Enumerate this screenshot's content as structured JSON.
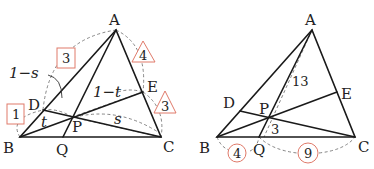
{
  "accent_color": "#e07a6a",
  "left_diagram": {
    "points": {
      "A": "A",
      "B": "B",
      "C": "C",
      "D": "D",
      "E": "E",
      "P": "P",
      "Q": "Q"
    },
    "segment_labels": {
      "one_minus_s": "1−s",
      "one_minus_t": "1−t",
      "t": "t",
      "s": "s"
    },
    "ratio_boxes": {
      "square_3": "3",
      "square_1": "1",
      "triangle_4": "4",
      "triangle_3": "3"
    }
  },
  "right_diagram": {
    "points": {
      "A": "A",
      "B": "B",
      "C": "C",
      "D": "D",
      "E": "E",
      "P": "P",
      "Q": "Q"
    },
    "segment_labels": {
      "AP": "13",
      "PQ": "3"
    },
    "ratio_circles": {
      "BQ": "4",
      "QC": "9"
    }
  }
}
